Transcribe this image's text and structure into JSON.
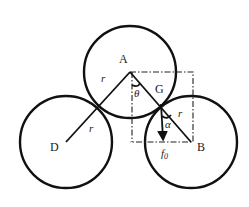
{
  "diagram": {
    "title": "",
    "points": {
      "A": {
        "label": "A",
        "x": 130,
        "y": 72
      },
      "G": {
        "label": "G",
        "x": 160,
        "y": 104
      },
      "D": {
        "label": "D",
        "x": 66,
        "y": 142
      },
      "B": {
        "label": "B",
        "x": 191,
        "y": 142
      }
    },
    "circles": [
      {
        "name": "circle-A",
        "cx": 130,
        "cy": 72,
        "r": 46
      },
      {
        "name": "circle-D",
        "cx": 66,
        "cy": 142,
        "r": 46
      },
      {
        "name": "circle-B",
        "cx": 191,
        "cy": 142,
        "r": 46
      }
    ],
    "labels": {
      "radius_AD": "r",
      "radius_D": "r",
      "radius_B": "r",
      "angle_theta": "θ",
      "angle_alpha": "α",
      "force": "f",
      "force_sub": "0"
    },
    "colors": {
      "stroke": "#111111",
      "background": "#ffffff"
    }
  }
}
